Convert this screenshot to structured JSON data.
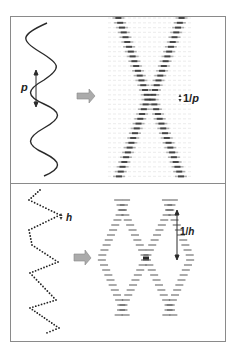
{
  "figure": {
    "top_panel": {
      "description": "Continuous helix (sine projection) and its diffraction X-pattern",
      "pitch_label": "p",
      "layer_line_label_prefix": "1/",
      "layer_line_label_var": "p",
      "arrow_color": "#a9a9a9"
    },
    "bottom_panel": {
      "description": "Discontinuous helix (dotted) and its diffraction pattern",
      "rise_label": "h",
      "layer_label_prefix": "1/",
      "layer_label_var": "h",
      "arrow_color": "#a9a9a9"
    },
    "colors": {
      "border": "#8a8a8a",
      "line": "#2a2a2a",
      "pattern": "#555555"
    }
  }
}
